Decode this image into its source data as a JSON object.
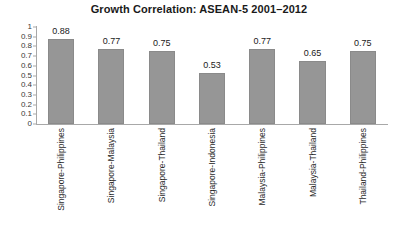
{
  "chart_data": {
    "type": "bar",
    "title": "Growth Correlation: ASEAN-5 2001–2012",
    "xlabel": "",
    "ylabel": "",
    "ylim": [
      0,
      1
    ],
    "grid": false,
    "legend": null,
    "categories": [
      "Singapore-Philippines",
      "Singapore-Malaysia",
      "Singapore-Thailand",
      "Singapore-Indonesia",
      "Malaysia-Philippines",
      "Malaysia-Thailand",
      "Thailand-Philippines"
    ],
    "values": [
      0.88,
      0.77,
      0.75,
      0.53,
      0.77,
      0.65,
      0.75
    ],
    "data_labels": [
      "0.88",
      "0.77",
      "0.75",
      "0.53",
      "0.77",
      "0.65",
      "0.75"
    ],
    "y_ticks": [
      "1",
      "0.9",
      "0.8",
      "0.7",
      "0.6",
      "0.5",
      "0.4",
      "0.3",
      "0.2",
      "0.1",
      "0"
    ],
    "y_tick_values": [
      1,
      0.9,
      0.8,
      0.7,
      0.6,
      0.5,
      0.4,
      0.3,
      0.2,
      0.1,
      0
    ],
    "bar_color": "#969696",
    "bar_border_color": "#8a8a8a",
    "axis_color": "#a8a8a8",
    "background_color": "#ffffff",
    "title_color": "#1a1a1a"
  }
}
